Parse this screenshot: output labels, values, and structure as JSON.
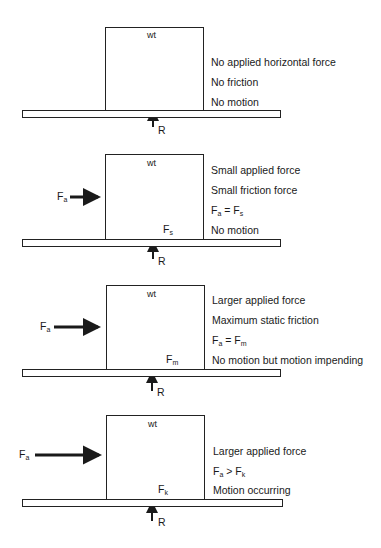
{
  "diagram": {
    "panels": [
      {
        "weight_label": "wt",
        "reaction_label": "R",
        "applied_label": null,
        "friction_label": null,
        "descriptions": [
          "No applied horizontal force",
          "No friction",
          "No motion"
        ]
      },
      {
        "weight_label": "wt",
        "reaction_label": "R",
        "applied_label": {
          "main": "F",
          "sub": "a"
        },
        "friction_label": {
          "main": "F",
          "sub": "s"
        },
        "descriptions": [
          "Small applied force",
          "Small friction force",
          {
            "lhs": "F",
            "lhs_sub": "a",
            "op": "=",
            "rhs": "F",
            "rhs_sub": "s"
          },
          "No motion"
        ]
      },
      {
        "weight_label": "wt",
        "reaction_label": "R",
        "applied_label": {
          "main": "F",
          "sub": "a"
        },
        "friction_label": {
          "main": "F",
          "sub": "m"
        },
        "descriptions": [
          "Larger applied force",
          "Maximum static friction",
          {
            "lhs": "F",
            "lhs_sub": "a",
            "op": "=",
            "rhs": "F",
            "rhs_sub": "m"
          },
          "No motion but motion impending"
        ]
      },
      {
        "weight_label": "wt",
        "reaction_label": "R",
        "applied_label": {
          "main": "F",
          "sub": "a"
        },
        "friction_label": {
          "main": "F",
          "sub": "k"
        },
        "descriptions": [
          "Larger applied force",
          {
            "lhs": "F",
            "lhs_sub": "a",
            "op": ">",
            "rhs": "F",
            "rhs_sub": "k"
          },
          "Motion occurring"
        ]
      }
    ]
  }
}
